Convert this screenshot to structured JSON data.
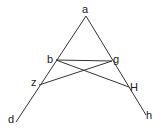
{
  "diagram": {
    "type": "geometry",
    "stroke_color": "#333333",
    "points": {
      "a": {
        "label": "a",
        "x": 86,
        "y": 16
      },
      "b": {
        "label": "b",
        "x": 56,
        "y": 60
      },
      "g": {
        "label": "g",
        "x": 112,
        "y": 61
      },
      "z": {
        "label": "z",
        "x": 39,
        "y": 85
      },
      "H": {
        "label": "H",
        "x": 129,
        "y": 87
      },
      "d": {
        "label": "d",
        "x": 16,
        "y": 122
      },
      "h": {
        "label": "h",
        "x": 146,
        "y": 115
      }
    },
    "segments": [
      [
        "a",
        "d"
      ],
      [
        "a",
        "h"
      ],
      [
        "b",
        "g"
      ],
      [
        "b",
        "H"
      ],
      [
        "z",
        "g"
      ]
    ]
  }
}
